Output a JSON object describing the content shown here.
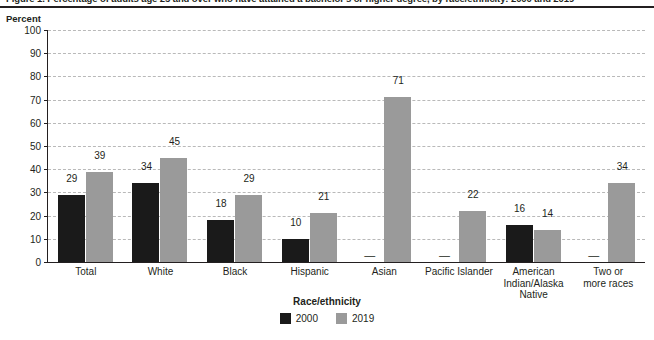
{
  "figure": {
    "title": "Figure 1. Percentage of adults age 25 and over who have attained a bachelor's or higher degree, by race/ethnicity: 2000 and 2019",
    "y_unit_label": "Percent"
  },
  "legend": {
    "title": "Race/ethnicity",
    "items": [
      {
        "label": "2000",
        "color": "#1a1a1a"
      },
      {
        "label": "2019",
        "color": "#9a9a9a"
      }
    ]
  },
  "chart_data": {
    "type": "bar",
    "title": "Figure 1. Percentage of adults age 25 and over who have attained a bachelor's or higher degree, by race/ethnicity: 2000 and 2019",
    "xlabel": "Race/ethnicity",
    "ylabel": "Percent",
    "ylim": [
      0,
      100
    ],
    "yticks": [
      0,
      10,
      20,
      30,
      40,
      50,
      60,
      70,
      80,
      90,
      100
    ],
    "ytick_labels": [
      "0",
      "10",
      "20",
      "30",
      "40",
      "50",
      "60",
      "70",
      "80",
      "90",
      "100"
    ],
    "grid": true,
    "legend_position": "bottom",
    "na_symbol": "—",
    "categories": [
      "Total",
      "White",
      "Black",
      "Hispanic",
      "Asian",
      "Pacific Islander",
      "American Indian/Alaska Native",
      "Two or more races"
    ],
    "category_lines": [
      [
        "Total"
      ],
      [
        "White"
      ],
      [
        "Black"
      ],
      [
        "Hispanic"
      ],
      [
        "Asian"
      ],
      [
        "Pacific Islander"
      ],
      [
        "American",
        "Indian/Alaska",
        "Native"
      ],
      [
        "Two or",
        "more races"
      ]
    ],
    "series": [
      {
        "name": "2000",
        "color": "#1a1a1a",
        "values": [
          29,
          34,
          18,
          10,
          null,
          null,
          16,
          null
        ],
        "labels": [
          "29",
          "34",
          "18",
          "10",
          "—",
          "—",
          "16",
          "—"
        ]
      },
      {
        "name": "2019",
        "color": "#9a9a9a",
        "values": [
          39,
          45,
          29,
          21,
          71,
          22,
          14,
          34
        ],
        "labels": [
          "39",
          "45",
          "29",
          "21",
          "71",
          "22",
          "14",
          "34"
        ]
      }
    ]
  }
}
